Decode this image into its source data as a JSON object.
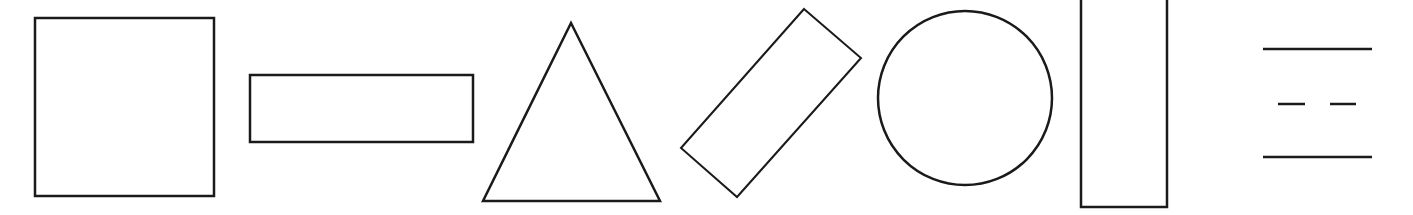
{
  "diagram": {
    "background": "#ffffff",
    "stroke_color": "#1a1a1a",
    "shapes": [
      {
        "id": "square",
        "type": "rect",
        "x": 35,
        "y": 18,
        "width": 179,
        "height": 178,
        "stroke_width": 2.5
      },
      {
        "id": "horizontal-rectangle",
        "type": "rect",
        "x": 250,
        "y": 75,
        "width": 223,
        "height": 67,
        "stroke_width": 2.5
      },
      {
        "id": "triangle",
        "type": "polygon",
        "points": "571,23 660,201 483,201",
        "stroke_width": 2.5
      },
      {
        "id": "rotated-rectangle",
        "type": "polygon",
        "points": "804,9 861,58 737,197 681,148",
        "stroke_width": 2
      },
      {
        "id": "circle",
        "type": "circle",
        "cx": 965,
        "cy": 98,
        "r": 87,
        "stroke_width": 2.5
      },
      {
        "id": "vertical-rectangle",
        "type": "rect",
        "x": 1081,
        "y": -10,
        "width": 86,
        "height": 217,
        "stroke_width": 2.5
      },
      {
        "id": "line-top",
        "type": "line",
        "x1": 1263,
        "y1": 49,
        "x2": 1372,
        "y2": 49,
        "stroke_width": 2.5
      },
      {
        "id": "dash-left",
        "type": "line",
        "x1": 1278,
        "y1": 104,
        "x2": 1305,
        "y2": 104,
        "stroke_width": 2.5
      },
      {
        "id": "dash-right",
        "type": "line",
        "x1": 1330,
        "y1": 104,
        "x2": 1356,
        "y2": 104,
        "stroke_width": 2.5
      },
      {
        "id": "line-bottom",
        "type": "line",
        "x1": 1263,
        "y1": 157,
        "x2": 1372,
        "y2": 157,
        "stroke_width": 2.5
      }
    ]
  }
}
